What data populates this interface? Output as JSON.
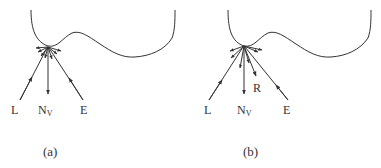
{
  "panels": [
    {
      "id": "a",
      "caption": "(a)",
      "labels": {
        "L": "L",
        "N": "N",
        "N_sub": "V",
        "E": "E"
      }
    },
    {
      "id": "b",
      "caption": "(b)",
      "labels": {
        "L": "L",
        "N": "N",
        "N_sub": "V",
        "E": "E",
        "R": "R"
      }
    }
  ],
  "colors": {
    "stroke": "#333333",
    "background": "#ffffff"
  }
}
